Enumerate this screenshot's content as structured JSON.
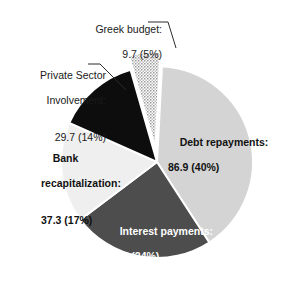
{
  "chart_data": {
    "type": "pie",
    "title": "",
    "subtitle": "",
    "unit": "billion euros",
    "total": 215.9,
    "legend": "none",
    "categories": [
      "Debt repayments",
      "Interest payments",
      "Bank recapitalization",
      "Private Sector Involvement",
      "Greek budget"
    ],
    "values": [
      86.9,
      52.3,
      37.3,
      29.7,
      9.7
    ],
    "percents": [
      40,
      24,
      17,
      14,
      5
    ],
    "colors": [
      "#d4d4d4",
      "#4d4d4d",
      "#efefef",
      "#0d0d0d",
      "#dcdcdc"
    ],
    "slices": [
      {
        "name": "Debt repayments",
        "label_line1": "Debt repayments:",
        "label_line2": "86.9 (40%)",
        "value": 86.9,
        "percent": 40,
        "color": "#d4d4d4",
        "fill_style": "solid",
        "label_position": "inside",
        "label_color": "#111111",
        "start_angle_deg": 3,
        "end_angle_deg": 147,
        "exploded": false
      },
      {
        "name": "Interest payments",
        "label_line1": "Interest payments:",
        "label_line2": "52.3 (24%)",
        "value": 52.3,
        "percent": 24,
        "color": "#4d4d4d",
        "fill_style": "solid",
        "label_position": "inside",
        "label_color": "#ffffff",
        "start_angle_deg": 147,
        "end_angle_deg": 233,
        "exploded": false
      },
      {
        "name": "Bank recapitalization",
        "label_line1": "Bank",
        "label_line2": "recapitalization:",
        "label_line3": "37.3 (17%)",
        "value": 37.3,
        "percent": 17,
        "color": "#efefef",
        "fill_style": "solid",
        "label_position": "inside",
        "label_color": "#111111",
        "start_angle_deg": 233,
        "end_angle_deg": 294,
        "exploded": false
      },
      {
        "name": "Private Sector Involvement",
        "label_line1": "Private Sector",
        "label_line2": "Involvement:",
        "label_line3": "29.7 (14%)",
        "value": 29.7,
        "percent": 14,
        "color": "#0d0d0d",
        "fill_style": "solid",
        "label_position": "outside-left",
        "label_color": "#1a1a1a",
        "start_angle_deg": 294,
        "end_angle_deg": 344,
        "exploded": false,
        "leader_line": true
      },
      {
        "name": "Greek budget",
        "label_line1": "Greek budget:",
        "label_line2": "9.7 (5%)",
        "value": 9.7,
        "percent": 5,
        "color": "#dcdcdc",
        "fill_style": "stippled",
        "label_position": "outside-top",
        "label_color": "#1a1a1a",
        "start_angle_deg": 344,
        "end_angle_deg": 363,
        "exploded": true,
        "leader_line": true
      }
    ],
    "geometry": {
      "center_x": 157,
      "center_y": 162,
      "radius": 96,
      "explode_offset": 14
    }
  },
  "labels": {
    "greek": {
      "line1": "Greek budget:",
      "line2": "9.7 (5%)"
    },
    "psi": {
      "line1": "Private Sector",
      "line2": "Involvement:",
      "line3": "29.7 (14%)"
    },
    "bank": {
      "line1": "Bank",
      "line2": "recapitalization:",
      "line3": "37.3 (17%)"
    },
    "debt": {
      "line1": "Debt repayments:",
      "line2": "86.9 (40%)"
    },
    "interest": {
      "line1": "Interest payments:",
      "line2": "52.3 (24%)"
    }
  }
}
